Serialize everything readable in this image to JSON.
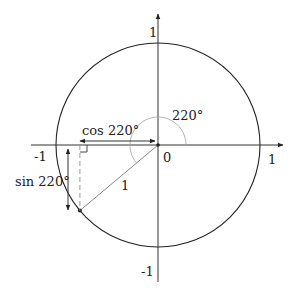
{
  "diagram": {
    "type": "unit-circle",
    "angle_deg": 220,
    "labels": {
      "y_top": "1",
      "y_bottom": "-1",
      "x_left": "-1",
      "x_right": "1",
      "origin": "0",
      "angle": "220°",
      "cos": "cos 220°",
      "sin": "sin 220°",
      "radius": "1"
    },
    "colors": {
      "stroke": "#222222",
      "light_stroke": "#999999"
    }
  }
}
